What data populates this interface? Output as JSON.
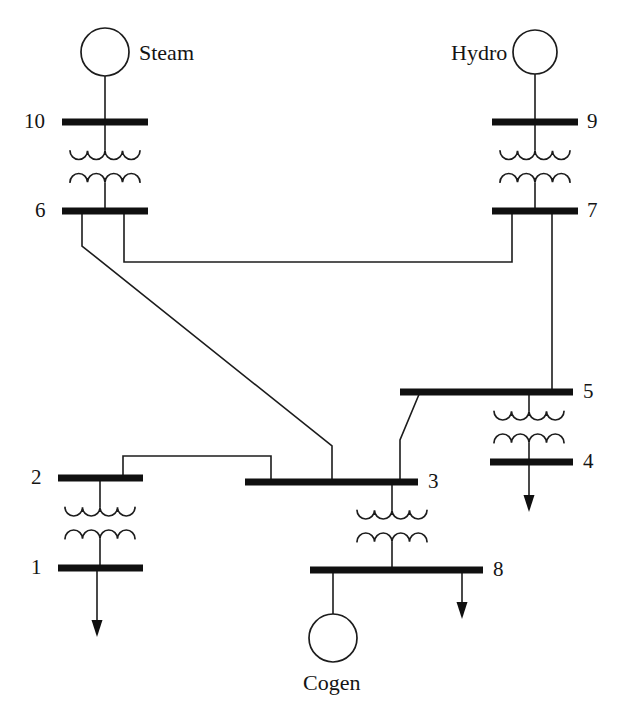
{
  "diagram": {
    "type": "single-line-power-system-diagram",
    "background_color": "#ffffff",
    "line_color": "#1c1c1c",
    "bus_color": "#101010",
    "generators": [
      {
        "id": "steam",
        "label": "Steam",
        "connected_bus": "10",
        "cx": 105,
        "cy": 52,
        "r": 24,
        "label_x": 139,
        "label_y": 42,
        "lead": "down"
      },
      {
        "id": "hydro",
        "label": "Hydro",
        "connected_bus": "9",
        "cx": 535,
        "cy": 52,
        "r": 22,
        "label_x": 451,
        "label_y": 42,
        "lead": "down"
      },
      {
        "id": "cogen",
        "label": "Cogen",
        "connected_bus": "8",
        "cx": 333,
        "cy": 638,
        "r": 24,
        "label_x": 303,
        "label_y": 672,
        "lead": "up"
      }
    ],
    "buses": [
      {
        "id": "10",
        "label": "10",
        "x1": 62,
        "x2": 148,
        "y": 122,
        "label_x": 24,
        "label_y": 111,
        "label_side": "left"
      },
      {
        "id": "6",
        "label": "6",
        "x1": 62,
        "x2": 148,
        "y": 211,
        "label_x": 35,
        "label_y": 200,
        "label_side": "left"
      },
      {
        "id": "9",
        "label": "9",
        "x1": 492,
        "x2": 578,
        "y": 122,
        "label_x": 587,
        "label_y": 111,
        "label_side": "right"
      },
      {
        "id": "7",
        "label": "7",
        "x1": 492,
        "x2": 578,
        "y": 211,
        "label_x": 587,
        "label_y": 200,
        "label_side": "right"
      },
      {
        "id": "5",
        "label": "5",
        "x1": 400,
        "x2": 573,
        "y": 392,
        "label_x": 583,
        "label_y": 381,
        "label_side": "right"
      },
      {
        "id": "4",
        "label": "4",
        "x1": 490,
        "x2": 573,
        "y": 462,
        "label_x": 583,
        "label_y": 451,
        "label_side": "right"
      },
      {
        "id": "2",
        "label": "2",
        "x1": 58,
        "x2": 143,
        "y": 478,
        "label_x": 31,
        "label_y": 467,
        "label_side": "left"
      },
      {
        "id": "1",
        "label": "1",
        "x1": 58,
        "x2": 143,
        "y": 568,
        "label_x": 31,
        "label_y": 557,
        "label_side": "left"
      },
      {
        "id": "3",
        "label": "3",
        "x1": 245,
        "x2": 418,
        "y": 482,
        "label_x": 428,
        "label_y": 471,
        "label_side": "right"
      },
      {
        "id": "8",
        "label": "8",
        "x1": 310,
        "x2": 483,
        "y": 570,
        "label_x": 493,
        "label_y": 559,
        "label_side": "right"
      }
    ],
    "transformers": [
      {
        "id": "t-10-6",
        "from_bus": "10",
        "to_bus": "6",
        "cx": 105,
        "top_y": 122,
        "bottom_y": 211
      },
      {
        "id": "t-9-7",
        "from_bus": "9",
        "to_bus": "7",
        "cx": 535,
        "top_y": 122,
        "bottom_y": 211
      },
      {
        "id": "t-5-4",
        "from_bus": "5",
        "to_bus": "4",
        "cx": 529,
        "top_y": 392,
        "bottom_y": 462
      },
      {
        "id": "t-2-1",
        "from_bus": "2",
        "to_bus": "1",
        "cx": 100,
        "top_y": 478,
        "bottom_y": 568
      },
      {
        "id": "t-3-8",
        "from_bus": "3",
        "to_bus": "8",
        "cx": 392,
        "top_y": 482,
        "bottom_y": 570
      }
    ],
    "transmission_lines": [
      {
        "id": "line-6-7",
        "from_bus": "6",
        "to_bus": "7",
        "points": "124,211 124,262 512,262 512,211"
      },
      {
        "id": "line-6-3",
        "from_bus": "6",
        "to_bus": "3",
        "points": "82,211 82,246 332,446 332,482"
      },
      {
        "id": "line-7-5",
        "from_bus": "7",
        "to_bus": "5",
        "points": "552,211 552,392"
      },
      {
        "id": "line-5-3",
        "from_bus": "5",
        "to_bus": "3",
        "points": "420,392 400,440 400,482"
      },
      {
        "id": "line-2-3",
        "from_bus": "2",
        "to_bus": "3",
        "points": "123,478 123,456 271,456 271,482"
      }
    ],
    "loads": [
      {
        "id": "load-bus-1",
        "bus": "1",
        "x": 97,
        "y_start": 568,
        "y_end": 637
      },
      {
        "id": "load-bus-4",
        "bus": "4",
        "x": 529,
        "y_start": 462,
        "y_end": 512
      },
      {
        "id": "load-bus-8",
        "bus": "8",
        "x": 462,
        "y_start": 570,
        "y_end": 619
      }
    ],
    "generator_leads": [
      {
        "id": "lead-steam",
        "x": 105,
        "y_start": 76,
        "y_end": 122
      },
      {
        "id": "lead-hydro",
        "x": 535,
        "y_start": 74,
        "y_end": 122
      },
      {
        "id": "lead-cogen",
        "x": 333,
        "y_start": 570,
        "y_end": 614
      }
    ]
  }
}
